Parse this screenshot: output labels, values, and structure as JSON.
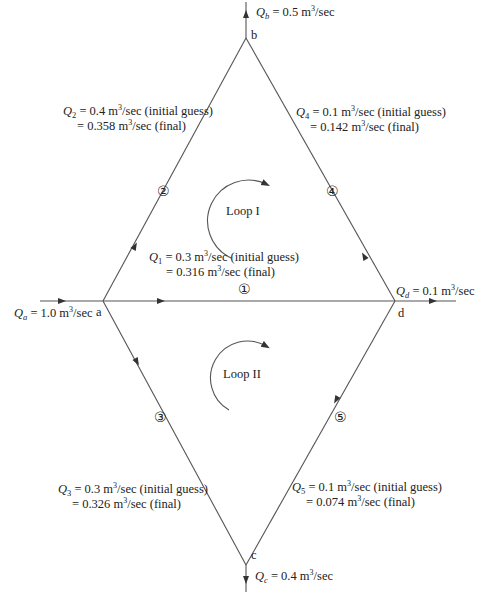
{
  "nodes": {
    "a": "a",
    "b": "b",
    "c": "c",
    "d": "d"
  },
  "external_flows": {
    "Qa": {
      "sym": "Q",
      "sub": "a",
      "value": " = 1.0 m",
      "unit": "/sec"
    },
    "Qb": {
      "sym": "Q",
      "sub": "b",
      "value": " = 0.5 m",
      "unit": "/sec"
    },
    "Qc": {
      "sym": "Q",
      "sub": "c",
      "value": " = 0.4 m",
      "unit": "/sec"
    },
    "Qd": {
      "sym": "Q",
      "sub": "d",
      "value": " = 0.1 m",
      "unit": "/sec"
    }
  },
  "pipes": [
    {
      "id": "①",
      "sym": "Q",
      "sub": "1",
      "initial": " = 0.3 m",
      "initial_tail": "/sec (initial guess)",
      "final": "= 0.316 m",
      "final_tail": "/sec (final)"
    },
    {
      "id": "②",
      "sym": "Q",
      "sub": "2",
      "initial": " = 0.4 m",
      "initial_tail": "/sec (initial guess)",
      "final": "= 0.358 m",
      "final_tail": "/sec (final)"
    },
    {
      "id": "③",
      "sym": "Q",
      "sub": "3",
      "initial": " = 0.3 m",
      "initial_tail": "/sec (initial guess)",
      "final": "= 0.326 m",
      "final_tail": "/sec (final)"
    },
    {
      "id": "④",
      "sym": "Q",
      "sub": "4",
      "initial": " = 0.1 m",
      "initial_tail": "/sec (initial guess)",
      "final": "= 0.142 m",
      "final_tail": "/sec (final)"
    },
    {
      "id": "⑤",
      "sym": "Q",
      "sub": "5",
      "initial": " = 0.1 m",
      "initial_tail": "/sec (initial guess)",
      "final": "= 0.074 m",
      "final_tail": "/sec (final)"
    }
  ],
  "exponent": "3",
  "loops": {
    "loop1": "Loop I",
    "loop2": "Loop II"
  },
  "colors": {
    "line": "#555555",
    "text": "#222222"
  }
}
